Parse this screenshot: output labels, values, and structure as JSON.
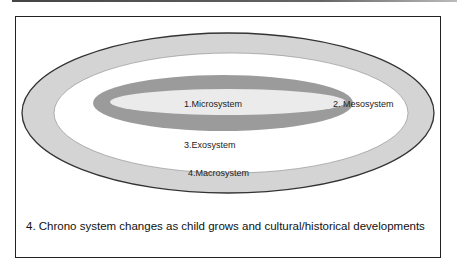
{
  "diagram": {
    "colors": {
      "macrosystem_fill": "#d4d4d4",
      "exosystem_fill": "#ffffff",
      "microsystem_ring_fill": "#9b9b9b",
      "microsystem_core_fill": "#ebebeb",
      "outline": "#333333"
    },
    "layers": [
      {
        "id": "microsystem",
        "label": "1.Microsystem"
      },
      {
        "id": "mesosystem",
        "label": "2. Mesosystem"
      },
      {
        "id": "exosystem",
        "label": "3.Exosystem"
      },
      {
        "id": "macrosystem",
        "label": "4.Macrosystem"
      }
    ],
    "caption": "4. Chrono system changes as child grows and cultural/historical developments"
  }
}
